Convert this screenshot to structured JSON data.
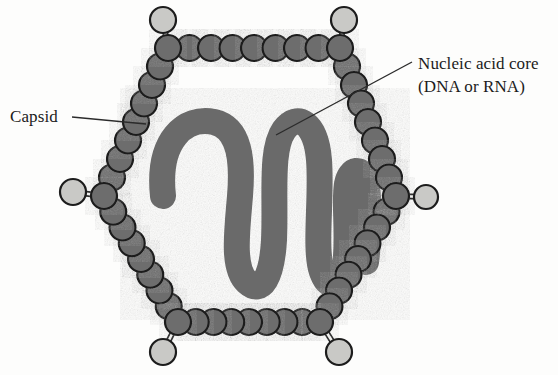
{
  "figure": {
    "background_color": "#fdfdfc",
    "labels": {
      "capsid": {
        "text": "Capsid",
        "x": 10,
        "y": 122,
        "anchor": "start",
        "leader_from": [
          72,
          117
        ],
        "leader_to": [
          146,
          124
        ]
      },
      "nucleic_acid": {
        "line1": "Nucleic acid core",
        "line2": "(DNA or RNA)",
        "x": 418,
        "y1": 69,
        "y2": 92,
        "anchor": "start",
        "leader_from": [
          412,
          62
        ],
        "leader_to": [
          276,
          135
        ]
      }
    },
    "colors": {
      "bead_fill": "#6d6d6d",
      "bead_stroke": "#1c1c1c",
      "spike_fill": "#c9c9c6",
      "spike_stroke": "#1c1c1c",
      "nucleic_fill": "#6a6a6a",
      "nucleic_stroke": "#6a6a6a",
      "leader_line": "#2b2b2b",
      "text": "#1b1b1b"
    },
    "capsid": {
      "name": "capsid-bead-ring",
      "bead_radius": 13,
      "vertices": [
        [
          168,
          48
        ],
        [
          340,
          48
        ],
        [
          396,
          196
        ],
        [
          320,
          322
        ],
        [
          178,
          322
        ],
        [
          104,
          196
        ]
      ],
      "beads_per_edge": [
        7,
        7,
        7,
        7,
        7,
        7
      ],
      "spikes": [
        {
          "name": "spike-top-left",
          "vertex": [
            168,
            48
          ],
          "tip": [
            163,
            20
          ],
          "tip_radius": 13
        },
        {
          "name": "spike-top-right",
          "vertex": [
            340,
            48
          ],
          "tip": [
            344,
            20
          ],
          "tip_radius": 13
        },
        {
          "name": "spike-right",
          "vertex": [
            396,
            196
          ],
          "tip": [
            426,
            197
          ],
          "tip_radius": 12
        },
        {
          "name": "spike-bottom-right",
          "vertex": [
            320,
            322
          ],
          "tip": [
            339,
            352
          ],
          "tip_radius": 13
        },
        {
          "name": "spike-bottom-left",
          "vertex": [
            178,
            322
          ],
          "tip": [
            163,
            352
          ],
          "tip_radius": 13
        },
        {
          "name": "spike-left",
          "vertex": [
            104,
            196
          ],
          "tip": [
            73,
            192
          ],
          "tip_radius": 13
        }
      ]
    },
    "nucleic_acid_core": {
      "name": "nucleic-acid-ribbon",
      "stroke_width": 26,
      "path": "M 163 196 C 157 140 185 116 214 122 C 240 128 243 160 240 196 C 237 232 232 268 247 282 C 262 296 272 276 274 240 C 276 196 270 150 284 130 C 297 112 316 122 319 160 C 322 198 314 250 322 272 C 330 294 344 286 346 256 C 348 226 344 200 347 184 C 350 168 362 166 366 182 C 370 198 369 240 366 262"
    }
  }
}
